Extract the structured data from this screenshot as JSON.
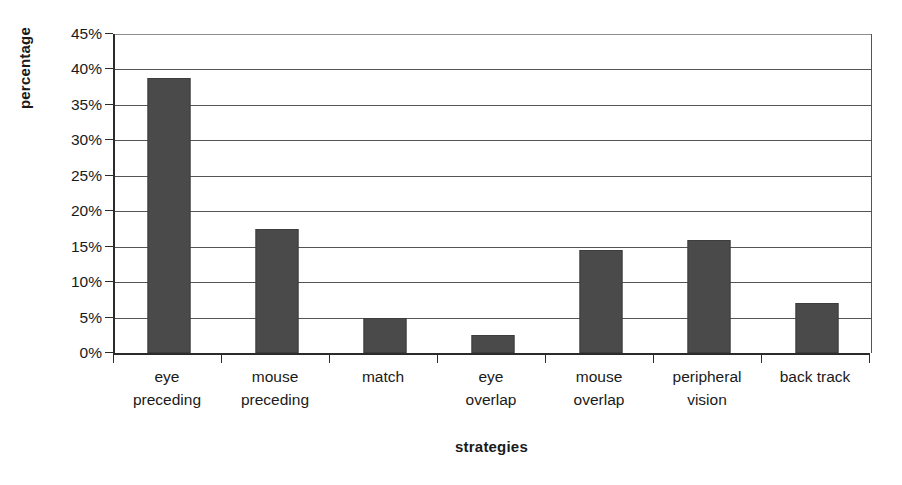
{
  "chart_data": {
    "type": "bar",
    "title": "",
    "subtitle": "",
    "xlabel": "strategies",
    "ylabel": "percentage",
    "categories": [
      "eye preceding",
      "mouse preceding",
      "match",
      "eye overlap",
      "mouse overlap",
      "peripheral vision",
      "back track"
    ],
    "category_lines": [
      [
        "eye",
        "preceding"
      ],
      [
        "mouse",
        "preceding"
      ],
      [
        "match",
        ""
      ],
      [
        "eye",
        "overlap"
      ],
      [
        "mouse",
        "overlap"
      ],
      [
        "peripheral",
        "vision"
      ],
      [
        "back track",
        ""
      ]
    ],
    "values": [
      38.8,
      17.5,
      5.0,
      2.5,
      14.5,
      16.0,
      7.0
    ],
    "value_unit": "%",
    "ylim": [
      0,
      45
    ],
    "ytick_step": 5,
    "ytick_labels": [
      "45%",
      "40%",
      "35%",
      "30%",
      "25%",
      "20%",
      "15%",
      "10%",
      "5%",
      "0%"
    ],
    "ytick_values": [
      45,
      40,
      35,
      30,
      25,
      20,
      15,
      10,
      5,
      0
    ],
    "grid": true,
    "legend": false,
    "legend_position": "none",
    "bar_color": "#4a4a4a",
    "axis_color": "#2b2b2b",
    "grid_color": "#555555",
    "background_color": "#ffffff"
  }
}
